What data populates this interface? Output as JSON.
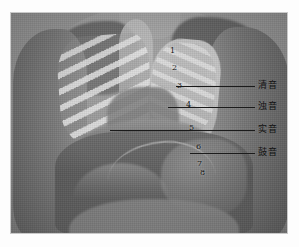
{
  "figure": {
    "kind": "anatomical-photograph",
    "plate": {
      "left": 11,
      "top": 13,
      "width": 276,
      "height": 220,
      "background_color": "#8d8d8d",
      "border_color": "#c9c9c9"
    },
    "page_background": "#ffffff"
  },
  "markers": [
    {
      "label": "1",
      "x": 170,
      "y": 47
    },
    {
      "label": "2",
      "x": 172,
      "y": 64
    },
    {
      "label": "3",
      "x": 177,
      "y": 82
    },
    {
      "label": "4",
      "x": 186,
      "y": 101
    },
    {
      "label": "5",
      "x": 189,
      "y": 124
    },
    {
      "label": "6",
      "x": 196,
      "y": 143
    },
    {
      "label": "7",
      "x": 197,
      "y": 160
    },
    {
      "label": "8",
      "x": 200,
      "y": 169
    }
  ],
  "leaders": [
    {
      "for": "qing-yin",
      "x": 176,
      "y": 86,
      "width": 79
    },
    {
      "for": "zhuo-yin",
      "x": 168,
      "y": 107,
      "width": 87
    },
    {
      "for": "shi-yin",
      "x": 110,
      "y": 130,
      "width": 145
    },
    {
      "for": "gu-yin",
      "x": 190,
      "y": 153,
      "width": 65
    }
  ],
  "sound_labels": [
    {
      "id": "qing-yin",
      "text": "清音",
      "x": 258,
      "y": 80,
      "meaning_index": 1
    },
    {
      "id": "zhuo-yin",
      "text": "浊音",
      "x": 258,
      "y": 101,
      "meaning_index": 2
    },
    {
      "id": "shi-yin",
      "text": "实音",
      "x": 258,
      "y": 124,
      "meaning_index": 3
    },
    {
      "id": "gu-yin",
      "text": "鼓音",
      "x": 258,
      "y": 147,
      "meaning_index": 4
    }
  ],
  "colors": {
    "line": "#1b1b1b",
    "marker_text": "#141414",
    "label_text": "#121212",
    "plate_mid_grey": "#8d8d8d"
  }
}
